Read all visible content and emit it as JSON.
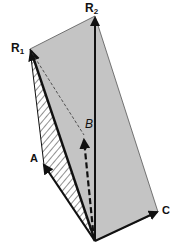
{
  "figure": {
    "type": "vector-parallelepiped-diagram",
    "colors": {
      "fill": "#c4c4c4",
      "stroke": "#111111",
      "hatch": "#333333",
      "background": "#ffffff"
    },
    "labels": {
      "r1": "R",
      "r1_sub": "1",
      "r2": "R",
      "r2_sub": "2",
      "a": "A",
      "b": "B",
      "c": "C"
    }
  }
}
